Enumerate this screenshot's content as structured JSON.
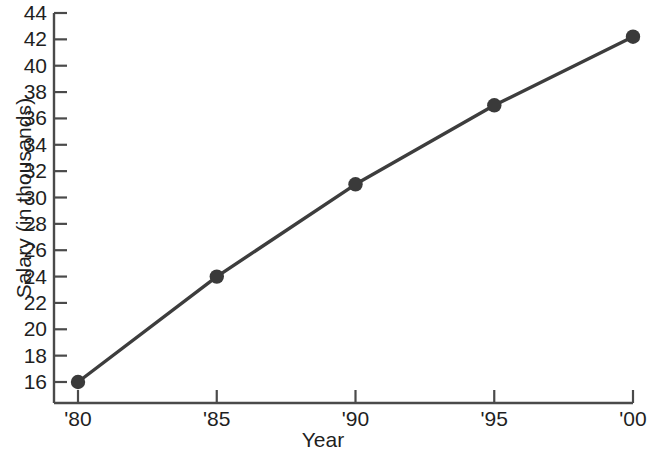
{
  "chart_data": {
    "type": "line",
    "title": "",
    "xlabel": "Year",
    "ylabel": "Salary (in thousands)",
    "categories": [
      "'80",
      "'85",
      "'90",
      "'95",
      "'00"
    ],
    "x": [
      1980,
      1985,
      1990,
      1995,
      2000
    ],
    "values": [
      16,
      24,
      31,
      37,
      42.2
    ],
    "series": [
      {
        "name": "Salary",
        "values": [
          16,
          24,
          31,
          37,
          42.2
        ]
      }
    ],
    "ylim": [
      15,
      45
    ],
    "xlim": [
      1979,
      2001
    ],
    "yticks": [
      16,
      18,
      20,
      22,
      24,
      26,
      28,
      30,
      32,
      34,
      36,
      38,
      40,
      42,
      44
    ],
    "ytick_labels": [
      "16",
      "18",
      "20",
      "22",
      "24",
      "26",
      "28",
      "30",
      "32",
      "34",
      "36",
      "38",
      "40",
      "42",
      "44"
    ],
    "xticks": [
      1980,
      1985,
      1990,
      1995,
      2000
    ],
    "xtick_labels": [
      "'80",
      "'85",
      "'90",
      "'95",
      "'00"
    ],
    "grid": false,
    "legend": false,
    "legend_position": "none",
    "marker": "circle",
    "line_color": "#3d3d3d",
    "marker_color": "#3a3a3a",
    "axis_color": "#4a4a4a",
    "background_color": "#ffffff"
  }
}
